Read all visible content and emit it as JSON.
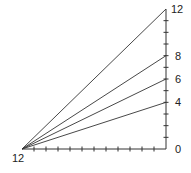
{
  "diagram": {
    "origin_label": "12",
    "origin": [
      22,
      149
    ],
    "axis_top": [
      166,
      9
    ],
    "axis_right_x": 166,
    "unit_px_vertical": 11.67,
    "unit_px_horizontal": 12.0,
    "vertical_ticks": 12,
    "horizontal_ticks": 12,
    "vertical_labels": [
      {
        "text": "12",
        "value": 12
      },
      {
        "text": "8",
        "value": 8
      },
      {
        "text": "6",
        "value": 6
      },
      {
        "text": "4",
        "value": 4
      },
      {
        "text": "0",
        "value": 0
      }
    ],
    "rays_to_values": [
      12,
      8,
      6,
      4
    ],
    "line_color": "#333333"
  }
}
